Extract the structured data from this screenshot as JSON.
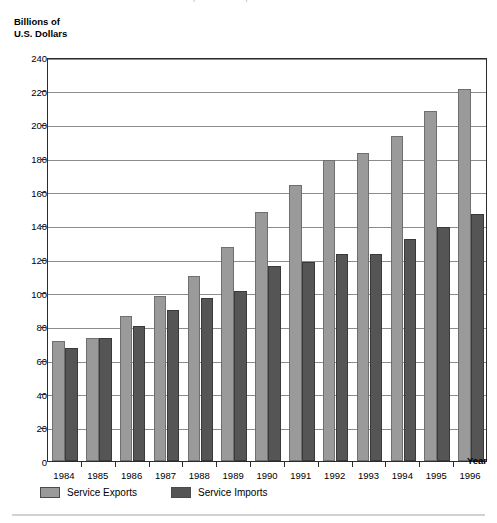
{
  "figure": {
    "top_cut_text": "Service Exports and Imports",
    "y_axis_caption_line1": "Billions of",
    "y_axis_caption_line2": "U.S. Dollars",
    "x_axis_caption": "Year"
  },
  "legend": {
    "position": "bottom-left",
    "items": [
      {
        "label": "Service Exports",
        "color": "#9a9a9a"
      },
      {
        "label": "Service Imports",
        "color": "#555555"
      }
    ]
  },
  "colors": {
    "exports": "#9a9a9a",
    "imports": "#555555",
    "grid": "#8c8c8c",
    "frame": "#2b2b2b",
    "background": "#ffffff"
  },
  "chart_data": {
    "type": "bar",
    "title": "Service Exports and Imports",
    "xlabel": "Year",
    "ylabel": "Billions of U.S. Dollars",
    "categories": [
      "1984",
      "1985",
      "1986",
      "1987",
      "1988",
      "1989",
      "1990",
      "1991",
      "1992",
      "1993",
      "1994",
      "1995",
      "1996"
    ],
    "series": [
      {
        "name": "Service Exports",
        "color": "#9a9a9a",
        "values": [
          71,
          73,
          86,
          98,
          110,
          127,
          148,
          164,
          179,
          183,
          193,
          208,
          221
        ]
      },
      {
        "name": "Service Imports",
        "color": "#555555",
        "values": [
          67,
          73,
          80,
          90,
          97,
          101,
          116,
          118,
          123,
          123,
          132,
          139,
          147
        ]
      }
    ],
    "ylim": [
      0,
      240
    ],
    "yticks": [
      0,
      20,
      40,
      60,
      80,
      100,
      120,
      140,
      160,
      180,
      200,
      220,
      240
    ],
    "ytick_labels": [
      "0",
      "20",
      "40",
      "60",
      "80",
      "100",
      "120",
      "140",
      "160",
      "180",
      "200",
      "220",
      "240"
    ],
    "grid": "horizontal",
    "legend_position": "below-axes-left"
  }
}
